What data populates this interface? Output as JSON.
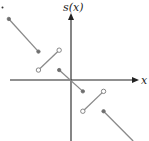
{
  "figure": {
    "type": "piecewise-linear-function-graph",
    "y_axis_label": "s(x)",
    "x_axis_label": "x",
    "colors": {
      "axes": "#222222",
      "segments": "#8a8a8a",
      "filled_endpoint": "#6f6f6f",
      "open_endpoint_stroke": "#7a7a7a"
    },
    "segments": [
      {
        "name": "segment-1",
        "from": [
          -4.2,
          4.3
        ],
        "to": [
          -2.2,
          2.0
        ],
        "from_end": "filled",
        "to_end": "filled"
      },
      {
        "name": "segment-2",
        "from": [
          -2.2,
          0.7
        ],
        "to": [
          -0.8,
          2.1
        ],
        "from_end": "open",
        "to_end": "open"
      },
      {
        "name": "segment-3",
        "from": [
          -0.8,
          0.7
        ],
        "to": [
          0.8,
          -0.8
        ],
        "from_end": "filled",
        "to_end": "filled"
      },
      {
        "name": "segment-4",
        "from": [
          0.8,
          -2.2
        ],
        "to": [
          2.2,
          -0.8
        ],
        "from_end": "open",
        "to_end": "open"
      },
      {
        "name": "segment-5",
        "from": [
          2.2,
          -2.2
        ],
        "to": [
          4.2,
          -4.3
        ],
        "from_end": "filled",
        "to_end": "none"
      }
    ],
    "stray_mark": "dot"
  }
}
